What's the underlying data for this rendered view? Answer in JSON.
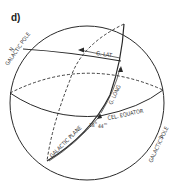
{
  "figure": {
    "panel_label": "d)",
    "labels": {
      "n_pole_letter": "N",
      "n_pole_text": "GALACTIC POLE",
      "s_pole_letter": "S",
      "s_pole_text": "GALACTIC POLE",
      "g_lat": "G. LAT",
      "g_long": "G. LONG",
      "cel_equator": "CEL. EQUATOR",
      "galactic_plane": "GALACTIC PLANE",
      "ra_hours": "18",
      "ra_hours_unit": "h",
      "ra_minutes": "44",
      "ra_minutes_unit": "m"
    },
    "colors": {
      "line": "#2a2a2a",
      "text": "#333333",
      "background": "#ffffff"
    }
  }
}
